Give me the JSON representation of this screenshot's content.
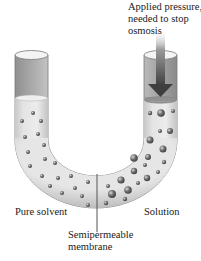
{
  "diagram": {
    "labels": {
      "applied_pressure": [
        "Applied pressure,",
        "needed to stop",
        "osmosis"
      ],
      "pure_solvent": "Pure solvent",
      "solution": "Solution",
      "membrane": [
        "Semipermeable",
        "membrane"
      ]
    },
    "icons": {
      "pressure_arrow": "down-arrow-icon"
    },
    "colors": {
      "tube_glass": "#c9c9c9",
      "tube_dark": "#8d8d8d",
      "liquid": "#dedede",
      "solute_particle": "#5a5a5a",
      "membrane": "#555555",
      "arrow": "#4a4a4a"
    }
  }
}
